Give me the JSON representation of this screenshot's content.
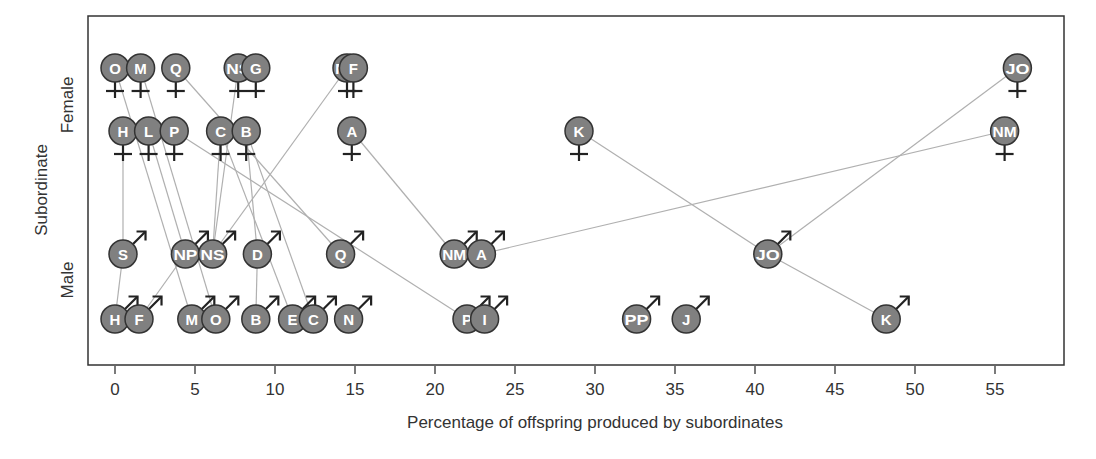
{
  "chart_data": {
    "type": "scatter",
    "title": "",
    "xlabel": "Percentage of offspring produced by subordinates",
    "ylabel": "Subordinate",
    "y_categories": [
      "Male",
      "Female"
    ],
    "xlim": [
      -1.7,
      59
    ],
    "x_ticks": [
      0,
      5,
      10,
      15,
      20,
      25,
      30,
      35,
      40,
      45,
      50,
      55
    ],
    "grid": false,
    "legend": null,
    "marker_color": "#808080",
    "line_color": "#b0b0b0",
    "series": [
      {
        "name": "Female",
        "symbol": "venus",
        "points": [
          {
            "label": "O",
            "x": 0.0,
            "row": 1
          },
          {
            "label": "M",
            "x": 1.6,
            "row": 1
          },
          {
            "label": "Q",
            "x": 3.8,
            "row": 1
          },
          {
            "label": "NS",
            "x": 7.7,
            "row": 1
          },
          {
            "label": "G",
            "x": 8.8,
            "row": 1
          },
          {
            "label": "NP",
            "x": 14.5,
            "row": 1
          },
          {
            "label": "F",
            "x": 14.9,
            "row": 1
          },
          {
            "label": "JO",
            "x": 56.4,
            "row": 1
          },
          {
            "label": "H",
            "x": 0.5,
            "row": 2
          },
          {
            "label": "L",
            "x": 2.1,
            "row": 2
          },
          {
            "label": "P",
            "x": 3.7,
            "row": 2
          },
          {
            "label": "C",
            "x": 6.6,
            "row": 2
          },
          {
            "label": "B",
            "x": 8.2,
            "row": 2
          },
          {
            "label": "A",
            "x": 14.8,
            "row": 2
          },
          {
            "label": "K",
            "x": 29.0,
            "row": 2
          },
          {
            "label": "NM",
            "x": 55.6,
            "row": 2
          }
        ]
      },
      {
        "name": "Male",
        "symbol": "mars",
        "points": [
          {
            "label": "S",
            "x": 0.5,
            "row": 3
          },
          {
            "label": "NP",
            "x": 4.4,
            "row": 3
          },
          {
            "label": "NS",
            "x": 6.1,
            "row": 3
          },
          {
            "label": "D",
            "x": 8.9,
            "row": 3
          },
          {
            "label": "Q",
            "x": 14.1,
            "row": 3
          },
          {
            "label": "NM",
            "x": 21.2,
            "row": 3
          },
          {
            "label": "A",
            "x": 22.9,
            "row": 3
          },
          {
            "label": "JO",
            "x": 40.8,
            "row": 3
          },
          {
            "label": "H",
            "x": 0.0,
            "row": 4
          },
          {
            "label": "F",
            "x": 1.5,
            "row": 4
          },
          {
            "label": "M",
            "x": 4.8,
            "row": 4
          },
          {
            "label": "O",
            "x": 6.3,
            "row": 4
          },
          {
            "label": "B",
            "x": 8.8,
            "row": 4
          },
          {
            "label": "E",
            "x": 11.1,
            "row": 4
          },
          {
            "label": "C",
            "x": 12.4,
            "row": 4
          },
          {
            "label": "N",
            "x": 14.6,
            "row": 4
          },
          {
            "label": "P",
            "x": 22.0,
            "row": 4
          },
          {
            "label": "I",
            "x": 23.1,
            "row": 4
          },
          {
            "label": "PP",
            "x": 32.6,
            "row": 4
          },
          {
            "label": "J",
            "x": 35.7,
            "row": 4
          },
          {
            "label": "K",
            "x": 48.2,
            "row": 4
          }
        ]
      }
    ],
    "links": [
      {
        "from": "F:O",
        "to": "M:M"
      },
      {
        "from": "F:M",
        "to": "M:O"
      },
      {
        "from": "F:Q",
        "to": "M:Q"
      },
      {
        "from": "F:NS",
        "to": "M:NS"
      },
      {
        "from": "F:NP",
        "to": "M:NS"
      },
      {
        "from": "F:H",
        "to": "M:S"
      },
      {
        "from": "M:S",
        "to": "M:H"
      },
      {
        "from": "F:L",
        "to": "M:NP"
      },
      {
        "from": "M:NP",
        "to": "M:F"
      },
      {
        "from": "F:P",
        "to": "M:P"
      },
      {
        "from": "F:C",
        "to": "M:NS"
      },
      {
        "from": "F:C",
        "to": "M:E"
      },
      {
        "from": "F:B",
        "to": "M:D"
      },
      {
        "from": "M:D",
        "to": "M:B"
      },
      {
        "from": "F:B",
        "to": "M:C"
      },
      {
        "from": "F:A",
        "to": "M:NM"
      },
      {
        "from": "M:A",
        "to": "F:NM"
      },
      {
        "from": "F:K",
        "to": "M:JO"
      },
      {
        "from": "M:JO",
        "to": "M:K"
      },
      {
        "from": "M:JO",
        "to": "F:JO"
      }
    ]
  },
  "axes": {
    "xlabel": "Percentage of offspring produced by subordinates",
    "ylabel": "Subordinate",
    "female_label": "Female",
    "male_label": "Male",
    "ticks": [
      "0",
      "5",
      "10",
      "15",
      "20",
      "25",
      "30",
      "35",
      "40",
      "45",
      "50",
      "55"
    ]
  }
}
